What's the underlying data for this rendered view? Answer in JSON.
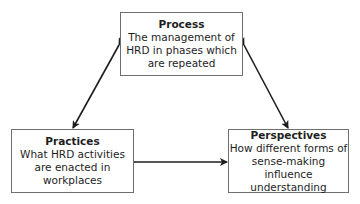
{
  "diagram": {
    "nodes": [
      {
        "id": "process",
        "title": "Process",
        "description_lines": [
          "The management of",
          "HRD in phases which",
          "are repeated"
        ]
      },
      {
        "id": "practices",
        "title": "Practices",
        "description_lines": [
          "What HRD activities",
          "are enacted in",
          "workplaces"
        ]
      },
      {
        "id": "perspectives",
        "title": "Perspectives",
        "description_lines": [
          "How different forms of",
          "sense-making influence",
          "understanding"
        ]
      }
    ],
    "edges": [
      {
        "from": "process",
        "to": "practices",
        "type": "bidirectional-arrow"
      },
      {
        "from": "process",
        "to": "perspectives",
        "type": "bidirectional-arrow"
      },
      {
        "from": "practices",
        "to": "perspectives",
        "type": "bidirectional-arrow"
      }
    ],
    "colors": {
      "box_border": "#6e6e6e",
      "arrow": "#1e1e1e",
      "text": "#1e1e1e",
      "background": "#ffffff"
    }
  }
}
